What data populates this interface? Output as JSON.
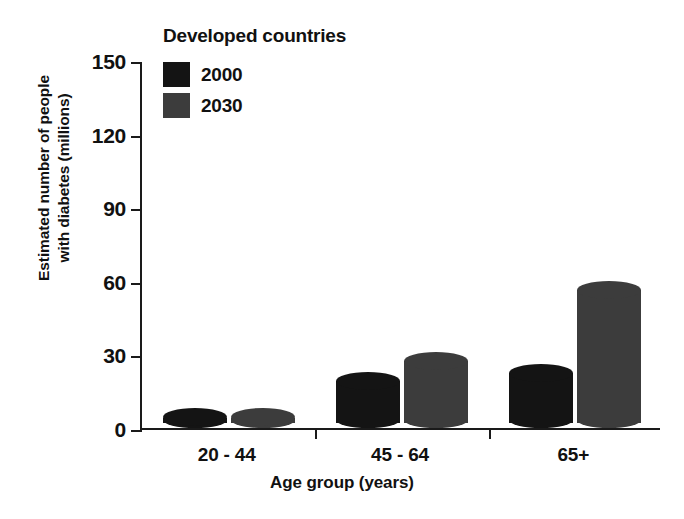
{
  "chart_data": {
    "type": "bar",
    "title": "Developed countries",
    "xlabel": "Age group (years)",
    "ylabel_line1": "Estimated number of people",
    "ylabel_line2": "with diabetes (millions)",
    "categories": [
      "20 - 44",
      "45 - 64",
      "65+"
    ],
    "series": [
      {
        "name": "2000",
        "color": "#141414",
        "values": [
          8,
          23,
          26
        ]
      },
      {
        "name": "2030",
        "color": "#3c3c3c",
        "values": [
          8,
          31,
          60
        ]
      }
    ],
    "ylim": [
      0,
      150
    ],
    "yticks": [
      0,
      30,
      60,
      90,
      120,
      150
    ],
    "ytick_labels": [
      "0",
      "30",
      "60",
      "90",
      "120",
      "150"
    ],
    "grid": false,
    "legend_position": "top-left-inside",
    "axis_color": "#1a1a1a"
  }
}
